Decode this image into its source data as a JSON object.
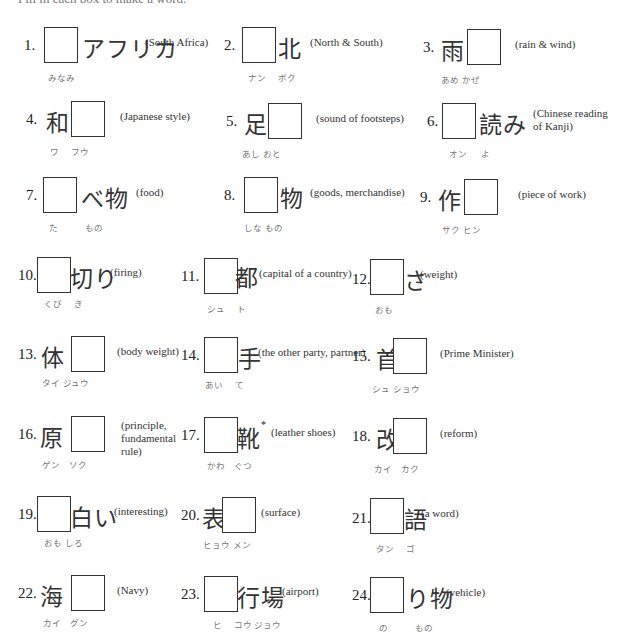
{
  "instruction": "Fill in each box to make a word.",
  "items": [
    {
      "num": "1.",
      "before": "",
      "after": "アフリカ",
      "gloss": "(South Africa)",
      "furigana": "みなみ"
    },
    {
      "num": "2.",
      "before": "",
      "after": "北",
      "gloss": "(North & South)",
      "furigana": "ナン　 ボク"
    },
    {
      "num": "3.",
      "before": "雨",
      "after": "",
      "gloss": "(rain & wind)",
      "furigana": "あめ かぜ"
    },
    {
      "num": "4.",
      "before": "和",
      "after": "",
      "gloss": "(Japanese style)",
      "furigana": "ワ　 フウ"
    },
    {
      "num": "5.",
      "before": "足",
      "after": "",
      "gloss": "(sound of footsteps)",
      "furigana": "あし おと"
    },
    {
      "num": "6.",
      "before": "",
      "after": "読み",
      "gloss": "(Chinese reading of Kanji)",
      "furigana": "オン　  よ"
    },
    {
      "num": "7.",
      "before": "",
      "after": "べ物",
      "gloss": "(food)",
      "furigana": "た　　　もの"
    },
    {
      "num": "8.",
      "before": "",
      "after": "物",
      "gloss": "(goods, merchandise)",
      "furigana": "しな もの"
    },
    {
      "num": "9.",
      "before": "作",
      "after": "",
      "gloss": "(piece of work)",
      "furigana": "サク ヒン"
    },
    {
      "num": "10.",
      "before": "",
      "after": "切り",
      "gloss": "(firing)",
      "furigana": "くび　 き"
    },
    {
      "num": "11.",
      "before": "",
      "after": "都",
      "gloss": "(capital of a country)",
      "furigana": "シュ　 ト"
    },
    {
      "num": "12.",
      "before": "",
      "after": "さ",
      "gloss": "(weight)",
      "furigana": "おも"
    },
    {
      "num": "13.",
      "before": "体",
      "after": "",
      "gloss": "(body weight)",
      "furigana": "タイ ジュウ"
    },
    {
      "num": "14.",
      "before": "",
      "after": "手",
      "gloss": "(the other party, partner)",
      "furigana": "あい　 て"
    },
    {
      "num": "15.",
      "before": "首",
      "after": "",
      "gloss": "(Prime Minister)",
      "furigana": "シュ ショウ"
    },
    {
      "num": "16.",
      "before": "原",
      "after": "",
      "gloss": "(principle, fundamental rule)",
      "furigana": "ゲン　ソク"
    },
    {
      "num": "17.",
      "before": "",
      "after": "靴",
      "asterisk": "*",
      "gloss": "(leather shoes)",
      "furigana": "かわ　ぐつ"
    },
    {
      "num": "18.",
      "before": "改",
      "after": "",
      "gloss": "(reform)",
      "furigana": "カイ　カク"
    },
    {
      "num": "19.",
      "before": "",
      "after": "白い",
      "gloss": "(interesting)",
      "furigana": "おも しろ"
    },
    {
      "num": "20.",
      "before": "表",
      "after": "",
      "gloss": "(surface)",
      "furigana": "ヒョウ メン"
    },
    {
      "num": "21.",
      "before": "",
      "after": "語",
      "gloss": "(a word)",
      "furigana": "タン　 ゴ"
    },
    {
      "num": "22.",
      "before": "海",
      "after": "",
      "gloss": "(Navy)",
      "furigana": "カイ　グン"
    },
    {
      "num": "23.",
      "before": "",
      "after": "行場",
      "gloss": "(airport)",
      "furigana": "ヒ　 コウ ジョウ"
    },
    {
      "num": "24.",
      "before": "",
      "after": "り物",
      "gloss": "(vehicle)",
      "furigana": "の　　　もの"
    }
  ]
}
